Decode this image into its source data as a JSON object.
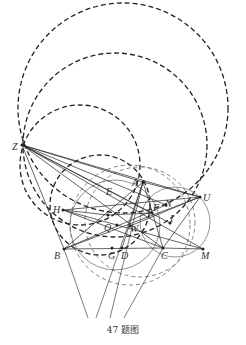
{
  "caption": "47 题图",
  "colors": {
    "ink": "#222222",
    "light": "#666666",
    "background": "#ffffff"
  },
  "points": [
    {
      "name": "Z",
      "x": 22,
      "y": 145,
      "lx": 12,
      "ly": 150
    },
    {
      "name": "A",
      "x": 143,
      "y": 182,
      "lx": 132,
      "ly": 186
    },
    {
      "name": "U",
      "x": 200,
      "y": 197,
      "lx": 203,
      "ly": 201
    },
    {
      "name": "H",
      "x": 63,
      "y": 210,
      "lx": 53,
      "ly": 213
    },
    {
      "name": "E",
      "x": 108,
      "y": 215,
      "lx": 106,
      "ly": 195
    },
    {
      "name": "F",
      "x": 152,
      "y": 213,
      "lx": 153,
      "ly": 211
    },
    {
      "name": "N",
      "x": 166,
      "y": 205,
      "lx": 165,
      "ly": 207
    },
    {
      "name": "I",
      "x": 170,
      "y": 223,
      "lx": 170,
      "ly": 222
    },
    {
      "name": "Q",
      "x": 117,
      "y": 225,
      "lx": 104,
      "ly": 231
    },
    {
      "name": "W",
      "x": 130,
      "y": 226,
      "lx": 130,
      "ly": 232
    },
    {
      "name": "B",
      "x": 64,
      "y": 249,
      "lx": 54,
      "ly": 259
    },
    {
      "name": "G",
      "x": 112,
      "y": 248,
      "lx": 108,
      "ly": 259
    },
    {
      "name": "D",
      "x": 122,
      "y": 248,
      "lx": 121,
      "ly": 259
    },
    {
      "name": "C",
      "x": 163,
      "y": 248,
      "lx": 161,
      "ly": 259
    },
    {
      "name": "M",
      "x": 203,
      "y": 249,
      "lx": 201,
      "ly": 259
    }
  ],
  "circles_dashed_dark": [
    {
      "cx": 123,
      "cy": 108,
      "r": 105
    },
    {
      "cx": 115,
      "cy": 145,
      "r": 92
    },
    {
      "cx": 80,
      "cy": 165,
      "r": 60
    },
    {
      "cx": 100,
      "cy": 205,
      "r": 50
    }
  ],
  "circles_dashed_light": [
    {
      "cx": 130,
      "cy": 225,
      "r": 60
    },
    {
      "cx": 140,
      "cy": 222,
      "r": 55
    }
  ],
  "circles_solid": [
    {
      "cx": 115,
      "cy": 225,
      "r": 45
    },
    {
      "cx": 175,
      "cy": 222,
      "r": 35
    }
  ],
  "segments": [
    [
      "Z",
      "A"
    ],
    [
      "Z",
      "U"
    ],
    [
      "Z",
      "B"
    ],
    [
      "Z",
      "C"
    ],
    [
      "Z",
      "M"
    ],
    [
      "Z",
      "F"
    ],
    [
      "Z",
      "I"
    ],
    [
      "Z",
      "N"
    ],
    [
      "A",
      "B"
    ],
    [
      "A",
      "C"
    ],
    [
      "A",
      "U"
    ],
    [
      "B",
      "C"
    ],
    [
      "C",
      "M"
    ],
    [
      "B",
      "U"
    ],
    [
      "H",
      "U"
    ],
    [
      "H",
      "M"
    ],
    [
      "H",
      "C"
    ],
    [
      "B",
      "N"
    ],
    [
      "E",
      "F"
    ],
    [
      "A",
      "D"
    ],
    [
      "U",
      "C"
    ],
    [
      "U",
      "W"
    ],
    [
      "H",
      "E"
    ]
  ],
  "rays": [
    {
      "x1": 143,
      "y1": 182,
      "x2": 96,
      "y2": 318
    },
    {
      "x1": 143,
      "y1": 182,
      "x2": 110,
      "y2": 318
    },
    {
      "x1": 163,
      "y1": 248,
      "x2": 124,
      "y2": 318
    },
    {
      "x1": 64,
      "y1": 249,
      "x2": 88,
      "y2": 318
    }
  ]
}
